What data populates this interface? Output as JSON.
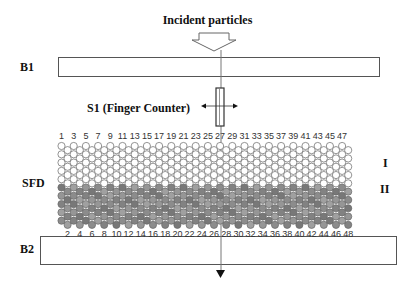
{
  "title": "Incident particles",
  "labels": {
    "b1": "B1",
    "s1": "S1 (Finger Counter)",
    "sfd": "SFD",
    "layer1": "I",
    "layer2": "II",
    "b2": "B2"
  },
  "sfd": {
    "columns": 48,
    "top_numbers": [
      "1",
      "3",
      "5",
      "7",
      "9",
      "11",
      "13",
      "15",
      "17",
      "19",
      "21",
      "23",
      "25",
      "27",
      "29",
      "31",
      "33",
      "35",
      "37",
      "39",
      "41",
      "43",
      "45",
      "47"
    ],
    "bottom_numbers": [
      "2",
      "4",
      "6",
      "8",
      "10",
      "12",
      "14",
      "16",
      "18",
      "20",
      "22",
      "24",
      "26",
      "28",
      "30",
      "32",
      "34",
      "36",
      "38",
      "40",
      "42",
      "44",
      "46",
      "48"
    ],
    "rows_per_layer": 5,
    "colors": {
      "layer1_fill": "#ffffff",
      "layer2_fill": "#8a8a8a",
      "stroke": "#666666"
    }
  },
  "icons": {
    "incident_arrow": "hollow-down-arrow",
    "s1_motion": "left-right-arrow",
    "exit_arrow": "solid-down-triangle"
  }
}
